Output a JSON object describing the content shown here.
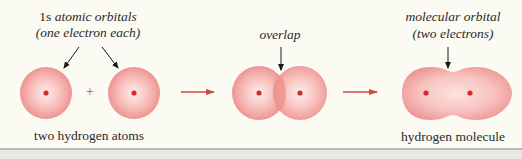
{
  "labels": {
    "atomic_orbitals_line1_prefix": "1s ",
    "atomic_orbitals_line1": "atomic orbitals",
    "atomic_orbitals_line2": "(one electron each)",
    "overlap": "overlap",
    "molecular_orbital_line1": "molecular orbital",
    "molecular_orbital_line2": "(two electrons)",
    "two_hydrogen_atoms": "two hydrogen atoms",
    "hydrogen_molecule": "hydrogen molecule",
    "plus": "+"
  },
  "colors": {
    "background": "#fbfaf3",
    "orbital_edge": "#ec8e8e",
    "orbital_center": "#fde6e4",
    "nucleus": "#d42a2a",
    "arrow_red": "#d9443f",
    "pointer_arrow": "#1a1a1a",
    "border": "#b9b8b2"
  },
  "stages": [
    {
      "name": "two hydrogen atoms",
      "orbitals": 2,
      "electrons_per_orbital": 1
    },
    {
      "name": "overlap",
      "orbitals": 2
    },
    {
      "name": "hydrogen molecule",
      "orbitals": 1,
      "electrons": 2
    }
  ]
}
